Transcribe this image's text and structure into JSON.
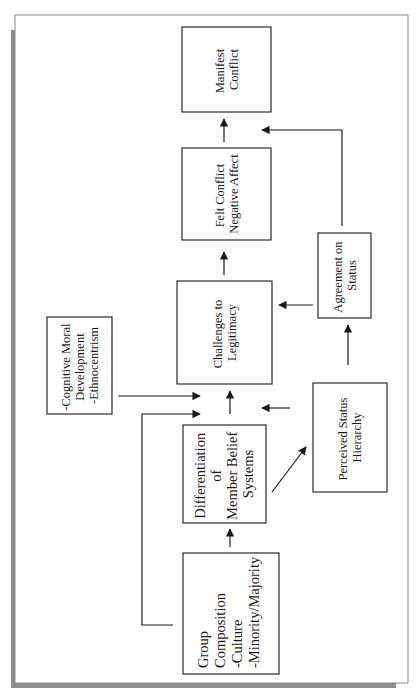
{
  "diagram": {
    "orientation": "rotated -90deg (text reads bottom-to-top)",
    "nodes": {
      "manifest_conflict": {
        "lines": [
          "Manifest",
          "Conflict"
        ]
      },
      "felt_conflict": {
        "lines": [
          "Felt Conflict",
          "Negative Affect"
        ]
      },
      "challenges": {
        "lines": [
          "Challenges to",
          "Legitimacy"
        ]
      },
      "agreement": {
        "lines": [
          "Agreement on",
          "Status"
        ]
      },
      "cognitive": {
        "lines": [
          "-Cognitive Moral",
          "Development",
          "-Ethnocentrism"
        ]
      },
      "perceived": {
        "lines": [
          "Perceived Status",
          "Hierarchy"
        ]
      },
      "differentiation": {
        "lines": [
          "Differentiation",
          "of",
          "Member Belief",
          "Systems"
        ]
      },
      "group_composition": {
        "lines": [
          "Group",
          "Composition",
          "-Culture",
          "-Minority/Majority"
        ]
      }
    },
    "edges": [
      {
        "from": "Group Composition",
        "to": "Differentiation of Member Belief Systems"
      },
      {
        "from": "Group Composition",
        "to": "Challenges to Legitimacy"
      },
      {
        "from": "Differentiation of Member Belief Systems",
        "to": "Challenges to Legitimacy"
      },
      {
        "from": "Differentiation of Member Belief Systems",
        "to": "Perceived Status Hierarchy"
      },
      {
        "from": "-Cognitive Moral Development -Ethnocentrism",
        "to": "Challenges to Legitimacy"
      },
      {
        "from": "Perceived Status Hierarchy",
        "to": "Challenges to Legitimacy"
      },
      {
        "from": "Perceived Status Hierarchy",
        "to": "Agreement on Status"
      },
      {
        "from": "Agreement on Status",
        "to": "Challenges to Legitimacy"
      },
      {
        "from": "Agreement on Status",
        "to": "Manifest Conflict"
      },
      {
        "from": "Challenges to Legitimacy",
        "to": "Felt Conflict Negative Affect"
      },
      {
        "from": "Felt Conflict Negative Affect",
        "to": "Manifest Conflict"
      }
    ]
  },
  "colors": {
    "frame_border": "#8a8a8a",
    "shadow": "#8c8c8c",
    "box_stroke": "#2a2a2a",
    "text": "#1a1a1a",
    "background": "#ffffff"
  }
}
